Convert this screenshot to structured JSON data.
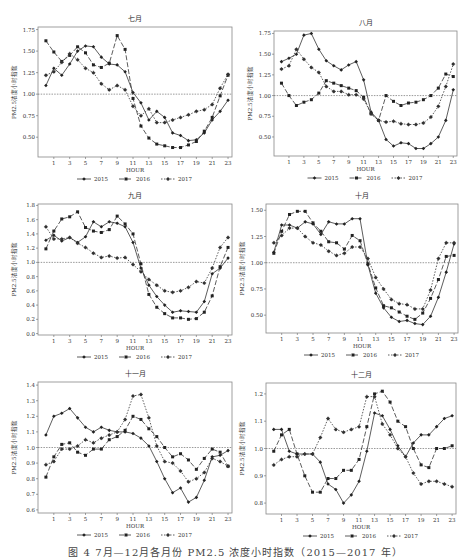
{
  "figure": {
    "caption": "图 4  7月—12月各月份 PM2.5 浓度小时指数（2015—2017 年）",
    "y_axis_label": "PM2.5浓度小时指数",
    "x_axis_label": "HOUR",
    "legend": [
      "2015",
      "2016",
      "2017"
    ]
  },
  "chart_data": [
    {
      "type": "line",
      "title": "七月",
      "xlabel": "HOUR",
      "ylabel": "PM2.5浓度小时指数",
      "x": [
        0,
        1,
        2,
        3,
        4,
        5,
        6,
        7,
        8,
        9,
        10,
        11,
        12,
        13,
        14,
        15,
        16,
        17,
        18,
        19,
        20,
        21,
        22,
        23
      ],
      "x_tick_labels": [
        "1",
        "3",
        "5",
        "7",
        "9",
        "11",
        "13",
        "15",
        "17",
        "19",
        "21",
        "23"
      ],
      "ylim": [
        0.27,
        1.78
      ],
      "y_ticks": [
        0.5,
        0.75,
        1.0,
        1.25,
        1.5,
        1.75
      ],
      "y_tick_labels": [
        "0.50",
        "0.75",
        "1.00",
        "1.25",
        "1.50",
        "1.75"
      ],
      "reference_line": 1.0,
      "grid": false,
      "legend_position": "bottom",
      "series": [
        {
          "name": "2015",
          "values": [
            1.1,
            1.3,
            1.22,
            1.35,
            1.5,
            1.56,
            1.55,
            1.43,
            1.35,
            1.34,
            1.26,
            1.02,
            0.9,
            0.7,
            0.8,
            0.73,
            0.55,
            0.52,
            0.46,
            0.47,
            0.55,
            0.7,
            0.8,
            0.93
          ]
        },
        {
          "name": "2016",
          "values": [
            1.62,
            1.49,
            1.38,
            1.45,
            1.55,
            1.48,
            1.34,
            1.31,
            1.36,
            1.68,
            1.52,
            0.95,
            0.63,
            0.49,
            0.42,
            0.4,
            0.38,
            0.38,
            0.41,
            0.45,
            0.57,
            0.73,
            0.98,
            1.22
          ]
        },
        {
          "name": "2017",
          "values": [
            1.22,
            1.26,
            1.37,
            1.47,
            1.4,
            1.3,
            1.25,
            1.12,
            1.05,
            1.1,
            1.05,
            0.86,
            0.75,
            0.83,
            0.67,
            0.67,
            0.7,
            0.73,
            0.76,
            0.8,
            0.82,
            0.88,
            1.07,
            1.23
          ]
        }
      ]
    },
    {
      "type": "line",
      "title": "八月",
      "xlabel": "HOUR",
      "ylabel": "PM2.5浓度小时指数",
      "x": [
        0,
        1,
        2,
        3,
        4,
        5,
        6,
        7,
        8,
        9,
        10,
        11,
        12,
        13,
        14,
        15,
        16,
        17,
        18,
        19,
        20,
        21,
        22,
        23
      ],
      "x_tick_labels": [
        "1",
        "3",
        "5",
        "7",
        "9",
        "11",
        "13",
        "15",
        "17",
        "19",
        "21",
        "23"
      ],
      "ylim": [
        0.27,
        1.78
      ],
      "y_ticks": [
        0.5,
        0.75,
        1.0,
        1.25,
        1.5,
        1.75
      ],
      "y_tick_labels": [
        "0.50",
        "0.75",
        "1.00",
        "1.25",
        "1.50",
        "1.75"
      ],
      "reference_line": 1.0,
      "grid": false,
      "legend_position": "bottom",
      "series": [
        {
          "name": "2015",
          "values": [
            1.41,
            1.45,
            1.5,
            1.73,
            1.75,
            1.56,
            1.42,
            1.36,
            1.31,
            1.37,
            1.41,
            1.19,
            0.8,
            0.7,
            0.47,
            0.39,
            0.43,
            0.42,
            0.36,
            0.36,
            0.42,
            0.5,
            0.7,
            1.07
          ]
        },
        {
          "name": "2016",
          "values": [
            1.15,
            1.0,
            0.88,
            0.92,
            0.95,
            1.03,
            1.18,
            1.15,
            1.12,
            1.09,
            1.06,
            0.98,
            0.78,
            0.7,
            1.0,
            0.93,
            0.88,
            0.91,
            0.92,
            0.95,
            1.0,
            1.09,
            1.26,
            1.23
          ]
        },
        {
          "name": "2017",
          "values": [
            1.32,
            1.36,
            1.56,
            1.44,
            1.34,
            1.28,
            1.11,
            1.05,
            1.05,
            1.01,
            1.01,
            0.96,
            0.78,
            0.7,
            0.68,
            0.69,
            0.66,
            0.65,
            0.65,
            0.67,
            0.74,
            0.87,
            1.11,
            1.38
          ]
        }
      ]
    },
    {
      "type": "line",
      "title": "九月",
      "xlabel": "HOUR",
      "ylabel": "PM2.5浓度小时指数",
      "x": [
        0,
        1,
        2,
        3,
        4,
        5,
        6,
        7,
        8,
        9,
        10,
        11,
        12,
        13,
        14,
        15,
        16,
        17,
        18,
        19,
        20,
        21,
        22,
        23
      ],
      "x_tick_labels": [
        "1",
        "3",
        "5",
        "7",
        "9",
        "11",
        "13",
        "15",
        "17",
        "19",
        "21",
        "23"
      ],
      "ylim": [
        -0.02,
        1.82
      ],
      "y_ticks": [
        0.0,
        0.2,
        0.4,
        0.6,
        0.8,
        1.0,
        1.2,
        1.4,
        1.6,
        1.8
      ],
      "y_tick_labels": [
        "0.0",
        "0.2",
        "0.4",
        "0.6",
        "0.8",
        "1.0",
        "1.2",
        "1.4",
        "1.6",
        "1.8"
      ],
      "reference_line": 1.0,
      "grid": false,
      "legend_position": "bottom",
      "series": [
        {
          "name": "2015",
          "values": [
            1.31,
            1.38,
            1.3,
            1.35,
            1.28,
            1.36,
            1.57,
            1.5,
            1.57,
            1.55,
            1.5,
            1.28,
            0.92,
            0.68,
            0.52,
            0.4,
            0.3,
            0.32,
            0.31,
            0.3,
            0.45,
            0.84,
            0.92,
            1.06
          ]
        },
        {
          "name": "2016",
          "values": [
            1.19,
            1.44,
            1.61,
            1.64,
            1.71,
            1.49,
            1.44,
            1.42,
            1.46,
            1.65,
            1.54,
            1.4,
            0.98,
            0.55,
            0.37,
            0.28,
            0.22,
            0.22,
            0.2,
            0.21,
            0.3,
            0.53,
            0.94,
            1.21
          ]
        },
        {
          "name": "2017",
          "values": [
            1.5,
            1.33,
            1.33,
            1.35,
            1.27,
            1.21,
            1.13,
            1.07,
            1.09,
            1.06,
            1.07,
            0.97,
            0.87,
            0.76,
            0.68,
            0.6,
            0.58,
            0.6,
            0.65,
            0.73,
            0.71,
            0.92,
            1.21,
            1.35
          ]
        }
      ]
    },
    {
      "type": "line",
      "title": "十月",
      "xlabel": "HOUR",
      "ylabel": "PM2.5浓度小时指数",
      "x": [
        0,
        1,
        2,
        3,
        4,
        5,
        6,
        7,
        8,
        9,
        10,
        11,
        12,
        13,
        14,
        15,
        16,
        17,
        18,
        19,
        20,
        21,
        22,
        23
      ],
      "x_tick_labels": [
        "1",
        "3",
        "5",
        "7",
        "9",
        "11",
        "13",
        "15",
        "17",
        "19",
        "21",
        "23"
      ],
      "ylim": [
        0.33,
        1.56
      ],
      "y_ticks": [
        0.5,
        0.75,
        1.0,
        1.25,
        1.5
      ],
      "y_tick_labels": [
        "0.50",
        "0.75",
        "1.00",
        "1.25",
        "1.50"
      ],
      "reference_line": 1.0,
      "grid": false,
      "legend_position": "bottom",
      "series": [
        {
          "name": "2015",
          "values": [
            1.1,
            1.36,
            1.36,
            1.33,
            1.39,
            1.37,
            1.27,
            1.39,
            1.37,
            1.37,
            1.42,
            1.42,
            0.98,
            0.71,
            0.57,
            0.48,
            0.44,
            0.45,
            0.42,
            0.41,
            0.49,
            0.67,
            0.91,
            1.18
          ]
        },
        {
          "name": "2016",
          "values": [
            1.09,
            1.3,
            1.46,
            1.49,
            1.49,
            1.38,
            1.3,
            1.2,
            1.19,
            1.13,
            1.26,
            1.21,
            0.99,
            0.76,
            0.59,
            0.57,
            0.53,
            0.49,
            0.46,
            0.52,
            0.66,
            0.84,
            1.06,
            1.07
          ]
        },
        {
          "name": "2017",
          "values": [
            1.19,
            1.26,
            1.33,
            1.33,
            1.25,
            1.19,
            1.17,
            1.11,
            1.07,
            1.09,
            1.15,
            1.15,
            1.04,
            0.86,
            0.75,
            0.65,
            0.61,
            0.6,
            0.56,
            0.56,
            0.74,
            1.04,
            1.19,
            1.19
          ]
        }
      ]
    },
    {
      "type": "line",
      "title": "十一月",
      "xlabel": "HOUR",
      "ylabel": "PM2.5浓度小时指数",
      "x": [
        0,
        1,
        2,
        3,
        4,
        5,
        6,
        7,
        8,
        9,
        10,
        11,
        12,
        13,
        14,
        15,
        16,
        17,
        18,
        19,
        20,
        21,
        22,
        23
      ],
      "x_tick_labels": [
        "1",
        "3",
        "5",
        "7",
        "9",
        "11",
        "13",
        "15",
        "17",
        "19",
        "21",
        "23"
      ],
      "ylim": [
        0.58,
        1.42
      ],
      "y_ticks": [
        0.6,
        0.7,
        0.8,
        0.9,
        1.0,
        1.1,
        1.2,
        1.3,
        1.4
      ],
      "y_tick_labels": [
        "0.6",
        "0.7",
        "0.8",
        "0.9",
        "1.0",
        "1.1",
        "1.2",
        "1.3",
        "1.4"
      ],
      "reference_line": 1.0,
      "grid": false,
      "legend_position": "bottom",
      "series": [
        {
          "name": "2015",
          "values": [
            1.08,
            1.2,
            1.22,
            1.25,
            1.19,
            1.13,
            1.1,
            1.13,
            1.11,
            1.1,
            1.1,
            1.09,
            1.06,
            1.01,
            0.91,
            0.8,
            0.71,
            0.74,
            0.65,
            0.68,
            0.79,
            0.94,
            0.95,
            0.98
          ]
        },
        {
          "name": "2016",
          "values": [
            0.81,
            0.94,
            1.02,
            1.03,
            0.97,
            0.95,
            0.99,
            0.99,
            1.05,
            1.07,
            1.11,
            1.2,
            1.18,
            1.12,
            1.07,
            1.0,
            0.94,
            0.96,
            0.92,
            0.86,
            0.93,
            0.99,
            0.97,
            0.88
          ]
        },
        {
          "name": "2017",
          "values": [
            0.89,
            0.91,
            0.99,
            0.99,
            1.01,
            1.05,
            1.03,
            1.06,
            1.08,
            1.1,
            1.18,
            1.33,
            1.34,
            1.19,
            1.01,
            0.91,
            0.9,
            0.85,
            0.78,
            0.8,
            0.84,
            0.93,
            0.91,
            0.88
          ]
        }
      ]
    },
    {
      "type": "line",
      "title": "十二月",
      "xlabel": "HOUR",
      "ylabel": "PM2.5浓度小时指数",
      "x": [
        0,
        1,
        2,
        3,
        4,
        5,
        6,
        7,
        8,
        9,
        10,
        11,
        12,
        13,
        14,
        15,
        16,
        17,
        18,
        19,
        20,
        21,
        22,
        23
      ],
      "x_tick_labels": [
        "1",
        "3",
        "5",
        "7",
        "9",
        "11",
        "13",
        "15",
        "17",
        "19",
        "21",
        "23"
      ],
      "ylim": [
        0.76,
        1.24
      ],
      "y_ticks": [
        0.8,
        0.9,
        1.0,
        1.1,
        1.2
      ],
      "y_tick_labels": [
        "0.8",
        "0.9",
        "1.0",
        "1.1",
        "1.2"
      ],
      "reference_line": 1.0,
      "grid": false,
      "legend_position": "bottom",
      "series": [
        {
          "name": "2015",
          "values": [
            1.07,
            1.07,
            0.99,
            0.98,
            0.98,
            0.98,
            0.95,
            0.87,
            0.85,
            0.8,
            0.83,
            0.88,
            0.99,
            1.13,
            1.12,
            1.07,
            1.01,
            0.97,
            1.02,
            1.05,
            1.05,
            1.08,
            1.11,
            1.12
          ]
        },
        {
          "name": "2016",
          "values": [
            0.99,
            1.05,
            1.07,
            0.98,
            0.9,
            0.84,
            0.84,
            0.89,
            0.89,
            0.92,
            0.92,
            0.96,
            1.08,
            1.2,
            1.21,
            1.17,
            1.1,
            1.08,
            1.0,
            0.94,
            0.93,
            1.0,
            1.0,
            1.01
          ]
        },
        {
          "name": "2017",
          "values": [
            0.94,
            0.96,
            0.97,
            0.97,
            0.98,
            0.98,
            1.04,
            1.11,
            1.07,
            1.06,
            1.07,
            1.08,
            1.19,
            1.19,
            1.09,
            1.05,
            1.0,
            0.97,
            0.91,
            0.87,
            0.88,
            0.88,
            0.87,
            0.86
          ]
        }
      ]
    }
  ]
}
